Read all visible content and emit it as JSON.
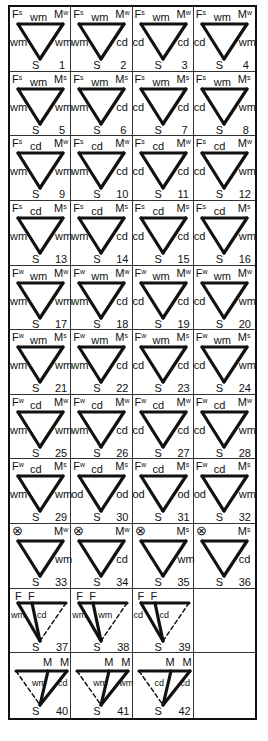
{
  "figure": {
    "grid": {
      "columns": 4,
      "rows": 11
    },
    "legend_notes": {
      "F": "female/father vertex",
      "M": "male/mother vertex",
      "S": "offspring vertex",
      "superscripts": {
        "s": "s",
        "w": "w"
      }
    },
    "cells": [
      {
        "n": "1",
        "type": "tri",
        "F": "F",
        "Fsup": "s",
        "M": "M",
        "Msup": "w",
        "top": "wm",
        "left": "wm",
        "right": "wm",
        "bottom": "S"
      },
      {
        "n": "2",
        "type": "tri",
        "F": "F",
        "Fsup": "s",
        "M": "M",
        "Msup": "w",
        "top": "wm",
        "left": "wm",
        "right": "cd",
        "bottom": "S"
      },
      {
        "n": "3",
        "type": "tri",
        "F": "F",
        "Fsup": "s",
        "M": "M",
        "Msup": "w",
        "top": "wm",
        "left": "cd",
        "right": "cd",
        "bottom": "S"
      },
      {
        "n": "4",
        "type": "tri",
        "F": "F",
        "Fsup": "s",
        "M": "M",
        "Msup": "w",
        "top": "wm",
        "left": "cd",
        "right": "wm",
        "bottom": "S"
      },
      {
        "n": "5",
        "type": "tri",
        "F": "F",
        "Fsup": "s",
        "M": "M",
        "Msup": "s",
        "top": "wm",
        "left": "wm",
        "right": "wm",
        "bottom": "S"
      },
      {
        "n": "6",
        "type": "tri",
        "F": "F",
        "Fsup": "s",
        "M": "M",
        "Msup": "s",
        "top": "wm",
        "left": "wm",
        "right": "cd",
        "bottom": "S"
      },
      {
        "n": "7",
        "type": "tri",
        "F": "F",
        "Fsup": "s",
        "M": "M",
        "Msup": "s",
        "top": "wm",
        "left": "cd",
        "right": "cd",
        "bottom": "S"
      },
      {
        "n": "8",
        "type": "tri",
        "F": "F",
        "Fsup": "s",
        "M": "M",
        "Msup": "s",
        "top": "wm",
        "left": "cd",
        "right": "wm",
        "bottom": "S"
      },
      {
        "n": "9",
        "type": "tri",
        "F": "F",
        "Fsup": "s",
        "M": "M",
        "Msup": "w",
        "top": "cd",
        "left": "wm",
        "right": "wm",
        "bottom": "S"
      },
      {
        "n": "10",
        "type": "tri",
        "F": "F",
        "Fsup": "s",
        "M": "M",
        "Msup": "w",
        "top": "cd",
        "left": "wm",
        "right": "cd",
        "bottom": "S"
      },
      {
        "n": "11",
        "type": "tri",
        "F": "F",
        "Fsup": "s",
        "M": "M",
        "Msup": "w",
        "top": "cd",
        "left": "cd",
        "right": "cd",
        "bottom": "S"
      },
      {
        "n": "12",
        "type": "tri",
        "F": "F",
        "Fsup": "s",
        "M": "M",
        "Msup": "w",
        "top": "cd",
        "left": "cd",
        "right": "wm",
        "bottom": "S"
      },
      {
        "n": "13",
        "type": "tri",
        "F": "F",
        "Fsup": "s",
        "M": "M",
        "Msup": "s",
        "top": "cd",
        "left": "wm",
        "right": "wm",
        "bottom": "S"
      },
      {
        "n": "14",
        "type": "tri",
        "F": "F",
        "Fsup": "s",
        "M": "M",
        "Msup": "s",
        "top": "cd",
        "left": "wm",
        "right": "cd",
        "bottom": "S"
      },
      {
        "n": "15",
        "type": "tri",
        "F": "F",
        "Fsup": "s",
        "M": "M",
        "Msup": "s",
        "top": "cd",
        "left": "cd",
        "right": "cd",
        "bottom": "S"
      },
      {
        "n": "16",
        "type": "tri",
        "F": "F",
        "Fsup": "s",
        "M": "M",
        "Msup": "s",
        "top": "cd",
        "left": "cd",
        "right": "wm",
        "bottom": "S"
      },
      {
        "n": "17",
        "type": "tri",
        "F": "F",
        "Fsup": "w",
        "M": "M",
        "Msup": "w",
        "top": "wm",
        "left": "wm",
        "right": "wm",
        "bottom": "S"
      },
      {
        "n": "18",
        "type": "tri",
        "F": "F",
        "Fsup": "w",
        "M": "M",
        "Msup": "w",
        "top": "wm",
        "left": "wm",
        "right": "cd",
        "bottom": "S"
      },
      {
        "n": "19",
        "type": "tri",
        "F": "F",
        "Fsup": "w",
        "M": "M",
        "Msup": "w",
        "top": "wm",
        "left": "cd",
        "right": "cd",
        "bottom": "S"
      },
      {
        "n": "20",
        "type": "tri",
        "F": "F",
        "Fsup": "w",
        "M": "M",
        "Msup": "w",
        "top": "wm",
        "left": "cd",
        "right": "wm",
        "bottom": "S"
      },
      {
        "n": "21",
        "type": "tri",
        "F": "F",
        "Fsup": "w",
        "M": "M",
        "Msup": "s",
        "top": "wm",
        "left": "wm",
        "right": "wm",
        "bottom": "S"
      },
      {
        "n": "22",
        "type": "tri",
        "F": "F",
        "Fsup": "w",
        "M": "M",
        "Msup": "s",
        "top": "wm",
        "left": "wm",
        "right": "cd",
        "bottom": "S"
      },
      {
        "n": "23",
        "type": "tri",
        "F": "F",
        "Fsup": "w",
        "M": "M",
        "Msup": "s",
        "top": "wm",
        "left": "cd",
        "right": "cd",
        "bottom": "S"
      },
      {
        "n": "24",
        "type": "tri",
        "F": "F",
        "Fsup": "w",
        "M": "M",
        "Msup": "s",
        "top": "wm",
        "left": "cd",
        "right": "wm",
        "bottom": "S"
      },
      {
        "n": "25",
        "type": "tri",
        "F": "F",
        "Fsup": "w",
        "M": "M",
        "Msup": "w",
        "top": "cd",
        "left": "wm",
        "right": "wm",
        "bottom": "S"
      },
      {
        "n": "26",
        "type": "tri",
        "F": "F",
        "Fsup": "w",
        "M": "M",
        "Msup": "w",
        "top": "cd",
        "left": "wm",
        "right": "cd",
        "bottom": "S"
      },
      {
        "n": "27",
        "type": "tri",
        "F": "F",
        "Fsup": "w",
        "M": "M",
        "Msup": "w",
        "top": "cd",
        "left": "cd",
        "right": "cd",
        "bottom": "S"
      },
      {
        "n": "28",
        "type": "tri",
        "F": "F",
        "Fsup": "w",
        "M": "M",
        "Msup": "w",
        "top": "cd",
        "left": "cd",
        "right": "wm",
        "bottom": "S"
      },
      {
        "n": "29",
        "type": "tri",
        "F": "F",
        "Fsup": "w",
        "M": "M",
        "Msup": "s",
        "top": "cd",
        "left": "wm",
        "right": "wm",
        "bottom": "S"
      },
      {
        "n": "30",
        "type": "tri",
        "F": "F",
        "Fsup": "w",
        "M": "M",
        "Msup": "s",
        "top": "cd",
        "left": "od",
        "right": "od",
        "bottom": "S"
      },
      {
        "n": "31",
        "type": "tri",
        "F": "F",
        "Fsup": "w",
        "M": "M",
        "Msup": "s",
        "top": "cd",
        "left": "od",
        "right": "od",
        "bottom": "S"
      },
      {
        "n": "32",
        "type": "tri",
        "F": "F",
        "Fsup": "w",
        "M": "M",
        "Msup": "s",
        "top": "cd",
        "left": "od",
        "right": "wm",
        "bottom": "S"
      },
      {
        "n": "33",
        "type": "x",
        "F": "⊗",
        "Fsup": "",
        "M": "M",
        "Msup": "w",
        "top": "",
        "left": "",
        "right": "wm",
        "bottom": "S"
      },
      {
        "n": "34",
        "type": "x",
        "F": "⊗",
        "Fsup": "",
        "M": "M",
        "Msup": "w",
        "top": "",
        "left": "",
        "right": "cd",
        "bottom": "S"
      },
      {
        "n": "35",
        "type": "x",
        "F": "⊗",
        "Fsup": "",
        "M": "M",
        "Msup": "s",
        "top": "",
        "left": "",
        "right": "wm",
        "bottom": "S"
      },
      {
        "n": "36",
        "type": "x",
        "F": "⊗",
        "Fsup": "",
        "M": "M",
        "Msup": "s",
        "top": "",
        "left": "",
        "right": "cd",
        "bottom": "S"
      },
      {
        "n": "37",
        "type": "ff",
        "F": "F",
        "F2": "F",
        "left": "wm",
        "inner": "cd",
        "bottom": "S"
      },
      {
        "n": "38",
        "type": "ff",
        "F": "F",
        "F2": "F",
        "left": "wm",
        "inner": "wm",
        "bottom": "S"
      },
      {
        "n": "39",
        "type": "ff",
        "F": "F",
        "F2": "F",
        "left": "cd",
        "inner": "cd",
        "bottom": "S"
      },
      {
        "n": "",
        "type": "empty"
      },
      {
        "n": "40",
        "type": "mm",
        "M": "M",
        "M2": "M",
        "inner": "wm",
        "right": "cd",
        "bottom": "S"
      },
      {
        "n": "41",
        "type": "mm",
        "M": "M",
        "M2": "M",
        "inner": "wm",
        "right": "wm",
        "bottom": "S"
      },
      {
        "n": "42",
        "type": "mm",
        "M": "M",
        "M2": "M",
        "inner": "cd",
        "right": "cd",
        "bottom": "S"
      },
      {
        "n": "",
        "type": "empty"
      }
    ]
  },
  "style": {
    "ink": "#111111",
    "background": "#ffffff",
    "grid_line": "#333333"
  }
}
